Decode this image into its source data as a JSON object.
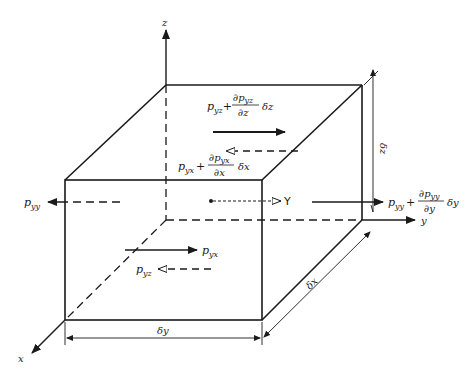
{
  "diagram": {
    "axes": {
      "x": "x",
      "y": "y",
      "z": "z"
    },
    "dimensions": {
      "dx": "δx",
      "dy": "δy",
      "dz": "δz"
    },
    "labels": {
      "pyy_left": {
        "p": "p",
        "sub": "yy"
      },
      "pyy_right": {
        "p": "p",
        "sub": "yy",
        "plus": "+",
        "num_d": "∂",
        "num_p": "p",
        "num_sub": "yy",
        "den": "∂y",
        "mult": "δy"
      },
      "pyz_top": {
        "p": "p",
        "sub": "yz",
        "plus": "+",
        "num_d": "∂",
        "num_p": "p",
        "num_sub": "yz",
        "den": "∂z",
        "mult": "δz"
      },
      "pyx_front": {
        "p": "p",
        "sub": "yx",
        "plus": "+",
        "num_d": "∂",
        "num_p": "p",
        "num_sub": "yx",
        "den": "∂x",
        "mult": "δx"
      },
      "pyx_back": {
        "p": "p",
        "sub": "yx"
      },
      "pyz_bottom": {
        "p": "p",
        "sub": "yz"
      },
      "body_force": "Y"
    },
    "colors": {
      "ink": "#1a1a1a",
      "background": "#ffffff"
    }
  }
}
